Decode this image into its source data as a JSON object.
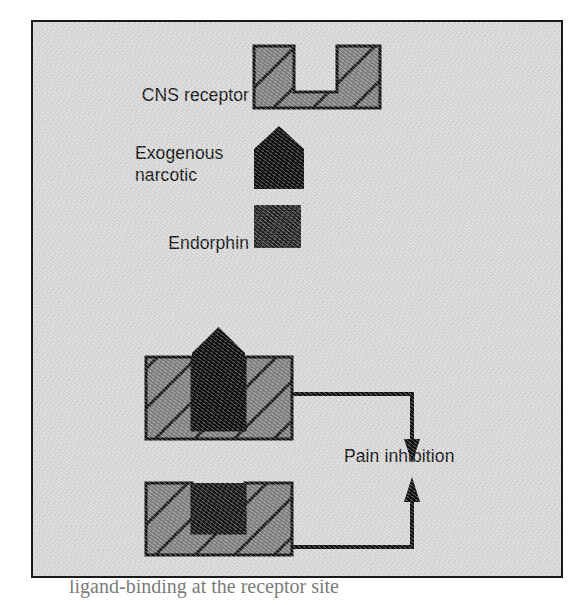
{
  "figure": {
    "background_color": "#d9d9d9",
    "border_color": "#1a1a1a",
    "hatch_fill_color": "#808080",
    "hatch_line_color": "#1a1a1a",
    "solid_black": "#0d0d0d",
    "endorphin_color": "#141414"
  },
  "legend": {
    "receptor_label": "CNS receptor",
    "narcotic_label": "Exogenous\nnarcotic",
    "endorphin_label": "Endorphin"
  },
  "outcome": {
    "label": "Pain inhibition"
  },
  "caption": {
    "text": "ligand-binding at the receptor site"
  },
  "diagram_data": {
    "type": "concept-diagram",
    "title": "Opioid receptor binding and pain inhibition",
    "legend_items": [
      {
        "name": "CNS receptor",
        "shape": "notched-block",
        "fill": "gray-hatched"
      },
      {
        "name": "Exogenous narcotic",
        "shape": "pentagon-up",
        "fill": "solid-black"
      },
      {
        "name": "Endorphin",
        "shape": "square",
        "fill": "dark-mottled"
      }
    ],
    "bindings": [
      {
        "ligand": "Exogenous narcotic",
        "receptor": "CNS receptor",
        "fit": "overfills-notch",
        "result": "Pain inhibition"
      },
      {
        "ligand": "Endorphin",
        "receptor": "CNS receptor",
        "fit": "fills-notch",
        "result": "Pain inhibition"
      }
    ],
    "arrows": [
      {
        "from": "narcotic-bound-receptor",
        "to": "Pain inhibition",
        "direction": "right-then-down"
      },
      {
        "from": "endorphin-bound-receptor",
        "to": "Pain inhibition",
        "direction": "right-then-up"
      }
    ]
  }
}
